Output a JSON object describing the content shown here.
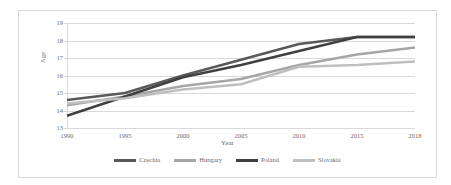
{
  "chart_data": {
    "type": "line",
    "title": "",
    "xlabel": "Year",
    "ylabel": "Age",
    "categories": [
      "1990",
      "1995",
      "2000",
      "2005",
      "2010",
      "2015",
      "2018"
    ],
    "ylim": [
      13,
      19
    ],
    "yticks": [
      "19",
      "18",
      "17",
      "16",
      "15",
      "14",
      "13"
    ],
    "grid": true,
    "legend_position": "bottom",
    "series": [
      {
        "name": "Czechia",
        "color": "#595959",
        "values": [
          14.6,
          15.0,
          16.0,
          16.9,
          17.8,
          18.2,
          18.2
        ]
      },
      {
        "name": "Hungary",
        "color": "#a6a6a6",
        "values": [
          14.3,
          14.8,
          15.4,
          15.8,
          16.6,
          17.2,
          17.6
        ]
      },
      {
        "name": "Poland",
        "color": "#404040",
        "values": [
          13.7,
          14.8,
          15.9,
          16.6,
          17.4,
          18.2,
          18.2
        ]
      },
      {
        "name": "Slovakia",
        "color": "#bfbfbf",
        "values": [
          14.4,
          14.7,
          15.2,
          15.5,
          16.5,
          16.6,
          16.8
        ]
      }
    ]
  }
}
